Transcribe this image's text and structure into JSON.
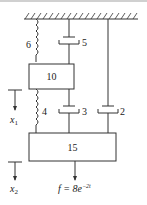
{
  "diagram": {
    "type": "mass-spring-damper system",
    "ground": "fixed ceiling (hatched)",
    "masses": [
      {
        "id": "m1",
        "label": "10"
      },
      {
        "id": "m2",
        "label": "15"
      }
    ],
    "springs": [
      {
        "label": "6",
        "connects": "ceiling to mass 10"
      },
      {
        "label": "4",
        "connects": "mass 10 to mass 15"
      }
    ],
    "dampers": [
      {
        "label": "5",
        "connects": "ceiling to mass 10"
      },
      {
        "label": "3",
        "connects": "mass 10 to mass 15"
      },
      {
        "label": "2",
        "connects": "ceiling to mass 15"
      }
    ],
    "displacements": [
      {
        "label": "x",
        "sub": "1",
        "mass": "10"
      },
      {
        "label": "x",
        "sub": "2",
        "mass": "15"
      }
    ],
    "force": {
      "label": "f = 8e",
      "exp": "−2t"
    }
  }
}
